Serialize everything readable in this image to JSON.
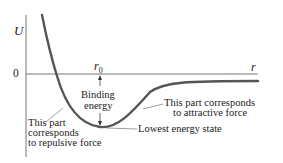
{
  "axes": {
    "y_label": "U",
    "x_label": "r",
    "zero_label": "0",
    "r0_label": "r",
    "r0_subscript": "0"
  },
  "annotations": {
    "binding_energy_line1": "Binding",
    "binding_energy_line2": "energy",
    "attractive_line1": "This part corresponds",
    "attractive_line2": "to attractive force",
    "repulsive_line1": "This part",
    "repulsive_line2": "corresponds",
    "repulsive_line3": "to repulsive force",
    "lowest_state": "Lowest energy state"
  },
  "colors": {
    "curve": "#555555",
    "axis": "#777777",
    "text": "#222222"
  }
}
